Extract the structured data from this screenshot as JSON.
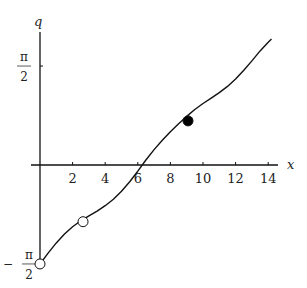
{
  "chart_data": {
    "type": "line",
    "title": "",
    "xlabel": "x",
    "ylabel": "q",
    "xlim": [
      0,
      14.6
    ],
    "ylim": [
      -1.65,
      2.4
    ],
    "x_ticks": [
      2,
      4,
      6,
      8,
      10,
      12,
      14
    ],
    "x_tick_labels": [
      "2",
      "4",
      "6",
      "8",
      "10",
      "12",
      "14"
    ],
    "y_ticks": [
      1.5708,
      -1.5708
    ],
    "y_tick_labels": [
      {
        "sign": "",
        "num": "π",
        "den": "2"
      },
      {
        "sign": "−",
        "num": "π",
        "den": "2"
      }
    ],
    "grid": false,
    "series": [
      {
        "name": "q(x)",
        "x": [
          0,
          0.5,
          1,
          1.5,
          2,
          2.5,
          3,
          3.5,
          4,
          4.5,
          5,
          5.5,
          6,
          6.5,
          7,
          7.5,
          8,
          8.5,
          9,
          9.5,
          10,
          10.5,
          11,
          11.5,
          12,
          12.5,
          13,
          13.5,
          14,
          14.2
        ],
        "y": [
          -1.571,
          -1.398,
          -1.237,
          -1.097,
          -0.98,
          -0.886,
          -0.807,
          -0.731,
          -0.646,
          -0.544,
          -0.417,
          -0.267,
          -0.099,
          0.08,
          0.245,
          0.392,
          0.528,
          0.654,
          0.771,
          0.881,
          0.976,
          1.062,
          1.15,
          1.247,
          1.365,
          1.504,
          1.653,
          1.811,
          1.949,
          2.0
        ]
      }
    ],
    "markers": [
      {
        "name": "start-point",
        "x": 0,
        "y": -1.5708,
        "style": "open"
      },
      {
        "name": "intermediate-point",
        "x": 2.64,
        "y": -0.9,
        "style": "open"
      },
      {
        "name": "highlight-point",
        "x": 9.08,
        "y": 0.7,
        "style": "filled"
      }
    ]
  }
}
